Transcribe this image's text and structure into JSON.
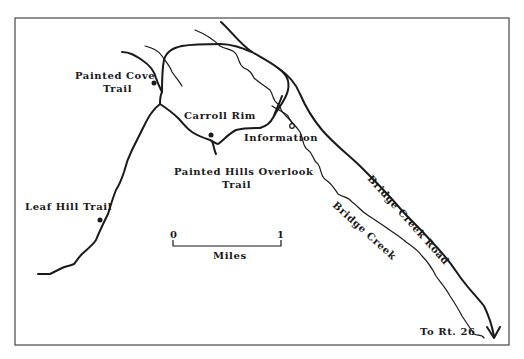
{
  "map": {
    "colors": {
      "ink": "#1a1a1a",
      "frame": "#555555",
      "background": "#ffffff"
    },
    "labels": {
      "painted_cove_line1": "Painted Cove",
      "painted_cove_line2": "Trail",
      "carroll_rim": "Carroll Rim",
      "information": "Information",
      "painted_hills_line1": "Painted Hills Overlook",
      "painted_hills_line2": "Trail",
      "leaf_hill": "Leaf Hill Trail",
      "bridge_creek_road": "Bridge Creek Road",
      "bridge_creek": "Bridge Creek",
      "to_rt26": "To Rt. 26"
    },
    "scale_bar": {
      "start_label": "0",
      "end_label": "1",
      "unit_label": "Miles"
    },
    "markers": [
      {
        "name": "painted-cove-trailhead",
        "icon": "filled-dot"
      },
      {
        "name": "carroll-rim-trailhead",
        "icon": "filled-dot"
      },
      {
        "name": "information-point",
        "icon": "open-dot"
      },
      {
        "name": "leaf-hill-trailhead",
        "icon": "filled-dot"
      }
    ],
    "direction_arrow": {
      "icon": "arrow-down-icon",
      "destination": "To Rt. 26"
    }
  }
}
